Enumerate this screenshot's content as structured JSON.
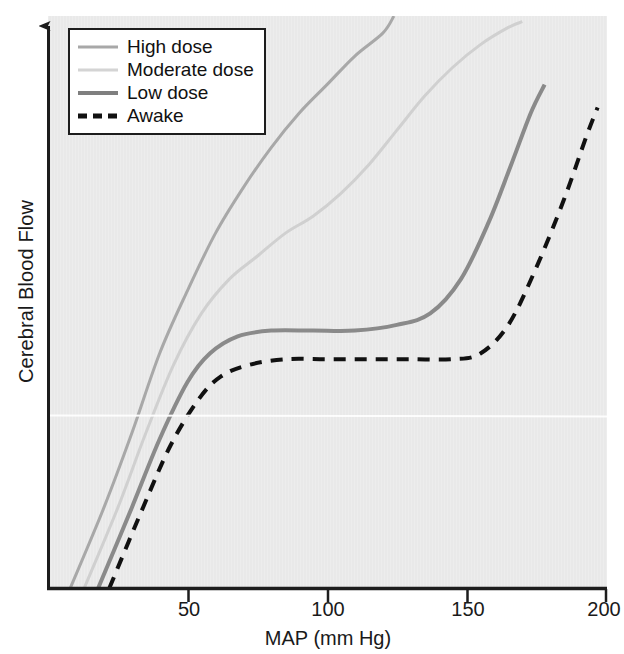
{
  "chart_data": {
    "type": "line",
    "title": "",
    "xlabel": "MAP (mm Hg)",
    "ylabel": "Cerebral Blood Flow",
    "xlim": [
      0,
      200
    ],
    "ylim": [
      0,
      100
    ],
    "xticks": [
      50,
      100,
      150,
      200
    ],
    "xtick_labels": [
      "50",
      "100",
      "150",
      "200"
    ],
    "yticks": [],
    "ytick_labels": [],
    "grid": false,
    "legend_position": "upper-left",
    "axis_style": "y-axis-arrow-no-ticks",
    "series": [
      {
        "name": "High dose",
        "color": "#a8a8a8",
        "style": "solid",
        "width": 3,
        "points": [
          [
            8,
            0
          ],
          [
            20,
            14
          ],
          [
            30,
            27
          ],
          [
            40,
            41
          ],
          [
            50,
            52
          ],
          [
            60,
            62
          ],
          [
            70,
            70
          ],
          [
            80,
            77
          ],
          [
            90,
            83
          ],
          [
            100,
            88
          ],
          [
            110,
            93
          ],
          [
            120,
            97
          ],
          [
            124,
            100
          ]
        ]
      },
      {
        "name": "Moderate dose",
        "color": "#d0d0d0",
        "style": "solid",
        "width": 3,
        "points": [
          [
            13,
            0
          ],
          [
            25,
            14
          ],
          [
            35,
            27
          ],
          [
            45,
            39
          ],
          [
            55,
            48
          ],
          [
            65,
            54
          ],
          [
            75,
            58
          ],
          [
            85,
            62
          ],
          [
            95,
            65
          ],
          [
            105,
            69
          ],
          [
            115,
            74
          ],
          [
            125,
            80
          ],
          [
            135,
            86
          ],
          [
            145,
            91
          ],
          [
            155,
            95
          ],
          [
            165,
            98
          ],
          [
            170,
            99
          ]
        ]
      },
      {
        "name": "Low dose",
        "color": "#8a8a8a",
        "style": "solid",
        "width": 4,
        "points": [
          [
            18,
            0
          ],
          [
            30,
            14
          ],
          [
            40,
            26
          ],
          [
            50,
            36
          ],
          [
            58,
            41
          ],
          [
            68,
            44
          ],
          [
            80,
            45
          ],
          [
            95,
            45
          ],
          [
            110,
            45
          ],
          [
            125,
            46
          ],
          [
            137,
            48
          ],
          [
            148,
            54
          ],
          [
            158,
            64
          ],
          [
            166,
            74
          ],
          [
            173,
            83
          ],
          [
            178,
            88
          ]
        ]
      },
      {
        "name": "Awake",
        "color": "#111111",
        "style": "dashed",
        "width": 4,
        "points": [
          [
            22,
            0
          ],
          [
            34,
            14
          ],
          [
            44,
            25
          ],
          [
            54,
            33
          ],
          [
            62,
            37
          ],
          [
            72,
            39
          ],
          [
            85,
            40
          ],
          [
            100,
            40
          ],
          [
            115,
            40
          ],
          [
            130,
            40
          ],
          [
            145,
            40
          ],
          [
            155,
            41
          ],
          [
            165,
            46
          ],
          [
            175,
            56
          ],
          [
            185,
            68
          ],
          [
            193,
            79
          ],
          [
            197,
            84
          ]
        ]
      }
    ]
  },
  "legend": {
    "entries": [
      {
        "label": "High dose",
        "color": "#a8a8a8",
        "style": "solid",
        "thickness": 3
      },
      {
        "label": "Moderate dose",
        "color": "#d4d4d4",
        "style": "solid",
        "thickness": 3
      },
      {
        "label": "Low dose",
        "color": "#7f7f7f",
        "style": "solid",
        "thickness": 4
      },
      {
        "label": "Awake",
        "color": "#111111",
        "style": "dashed",
        "thickness": 5
      }
    ]
  },
  "axes": {
    "x_title": "MAP (mm Hg)",
    "y_title": "Cerebral Blood Flow",
    "x_tick_labels": [
      "50",
      "100",
      "150",
      "200"
    ]
  },
  "colors": {
    "plot_background": "#e9e9e9",
    "axis": "#1d1d1d",
    "page_background": "#ffffff",
    "artifact_line": "#ffffff"
  }
}
